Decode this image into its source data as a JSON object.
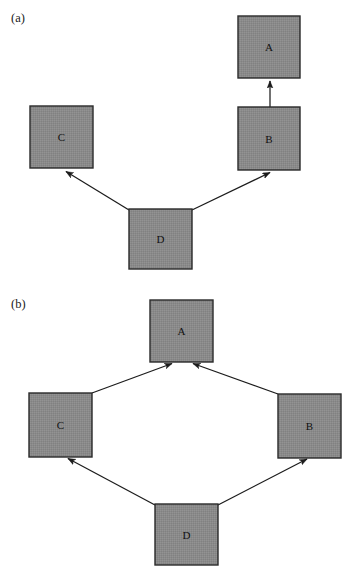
{
  "figure": {
    "background_color": "#ffffff",
    "node_fill_color": "#8a8a8a",
    "node_stroke_color": "#2a2a2a",
    "edge_color": "#1c1c1c",
    "node_size": 63
  },
  "panels": [
    {
      "id": "panel-a",
      "label": "(a)",
      "label_x": 11,
      "label_y": 22,
      "nodes": [
        {
          "id": "a-A",
          "label": "A",
          "x": 238,
          "y": 16,
          "w": 62,
          "h": 62
        },
        {
          "id": "a-C",
          "label": "C",
          "x": 30,
          "y": 106,
          "w": 63,
          "h": 62
        },
        {
          "id": "a-B",
          "label": "B",
          "x": 238,
          "y": 107,
          "w": 62,
          "h": 63
        },
        {
          "id": "a-D",
          "label": "D",
          "x": 129,
          "y": 209,
          "w": 63,
          "h": 60
        }
      ],
      "edges": [
        {
          "id": "a-edge-B-A",
          "from": "B",
          "to": "A",
          "x1": 270,
          "y1": 107,
          "x2": 270,
          "y2": 80
        },
        {
          "id": "a-edge-D-C",
          "from": "D",
          "to": "C",
          "x1": 129,
          "y1": 210,
          "x2": 65,
          "y2": 171
        },
        {
          "id": "a-edge-D-B",
          "from": "D",
          "to": "B",
          "x1": 192,
          "y1": 210,
          "x2": 271,
          "y2": 172
        }
      ]
    },
    {
      "id": "panel-b",
      "label": "(b)",
      "label_x": 11,
      "label_y": 308,
      "nodes": [
        {
          "id": "b-A",
          "label": "A",
          "x": 150,
          "y": 300,
          "w": 63,
          "h": 62
        },
        {
          "id": "b-C",
          "label": "C",
          "x": 29,
          "y": 393,
          "w": 63,
          "h": 64
        },
        {
          "id": "b-B",
          "label": "B",
          "x": 278,
          "y": 394,
          "w": 63,
          "h": 64
        },
        {
          "id": "b-D",
          "label": "D",
          "x": 155,
          "y": 504,
          "w": 63,
          "h": 61
        }
      ],
      "edges": [
        {
          "id": "b-edge-C-A",
          "from": "C",
          "to": "A",
          "x1": 92,
          "y1": 393,
          "x2": 173,
          "y2": 363
        },
        {
          "id": "b-edge-B-A",
          "from": "B",
          "to": "A",
          "x1": 278,
          "y1": 394,
          "x2": 192,
          "y2": 363
        },
        {
          "id": "b-edge-D-C",
          "from": "D",
          "to": "C",
          "x1": 155,
          "y1": 505,
          "x2": 67,
          "y2": 458
        },
        {
          "id": "b-edge-D-B",
          "from": "D",
          "to": "B",
          "x1": 218,
          "y1": 505,
          "x2": 308,
          "y2": 459
        }
      ]
    }
  ]
}
